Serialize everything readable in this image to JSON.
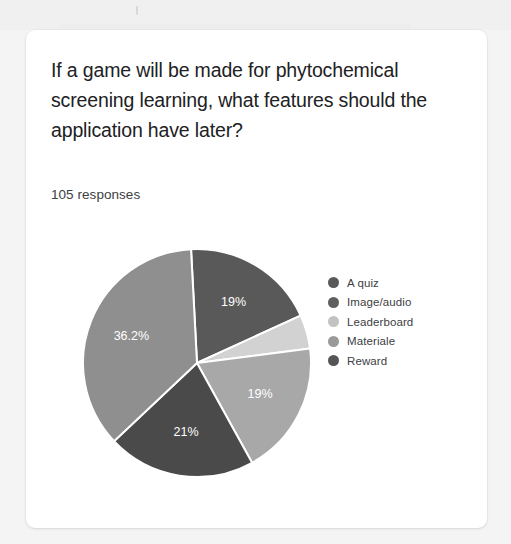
{
  "card": {
    "question_title": "If a game will be made for phytochemical screening learning, what features should the application have later?",
    "response_count_label": "105 responses"
  },
  "chart_data": {
    "type": "pie",
    "title": "If a game will be made for phytochemical screening learning, what features should the application have later?",
    "subtitle": "105 responses",
    "legend_position": "right",
    "categories": [
      "A quiz",
      "Image/audio",
      "Leaderboard",
      "Materiale",
      "Reward"
    ],
    "values": [
      19,
      4.8,
      19,
      21,
      36.2
    ],
    "value_unit": "%",
    "data_labels": [
      "19%",
      "",
      "19%",
      "21%",
      "36.2%"
    ],
    "colors": [
      "#595959",
      "#d2d2d2",
      "#a8a8a8",
      "#4a4a4a",
      "#8f8f8f"
    ],
    "slices": [
      {
        "label": "A quiz",
        "value": 19,
        "display": "19%",
        "color": "#595959",
        "label_visible": true
      },
      {
        "label": "Image/audio",
        "value": 4.8,
        "display": "",
        "color": "#d2d2d2",
        "label_visible": false
      },
      {
        "label": "Leaderboard",
        "value": 19,
        "display": "19%",
        "color": "#a8a8a8",
        "label_visible": true
      },
      {
        "label": "Materiale",
        "value": 21,
        "display": "21%",
        "color": "#4a4a4a",
        "label_visible": true
      },
      {
        "label": "Reward",
        "value": 36.2,
        "display": "36.2%",
        "color": "#8f8f8f",
        "label_visible": true
      }
    ],
    "start_angle_deg": -3,
    "grid": false
  },
  "legend": {
    "items": [
      {
        "label": "A quiz",
        "color": "#595959"
      },
      {
        "label": "Image/audio",
        "color": "#5f5f5f"
      },
      {
        "label": "Leaderboard",
        "color": "#c2c2c2"
      },
      {
        "label": "Materiale",
        "color": "#9a9a9a"
      },
      {
        "label": "Reward",
        "color": "#555555"
      }
    ]
  }
}
